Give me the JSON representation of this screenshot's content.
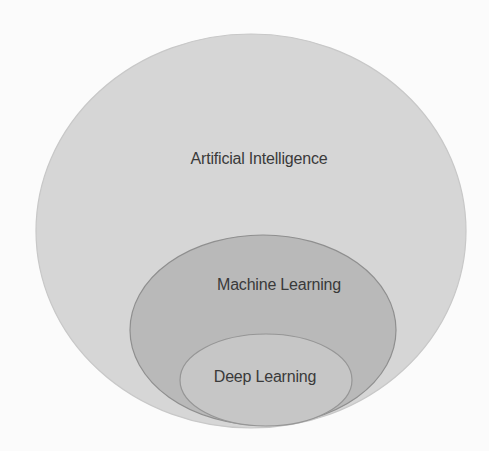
{
  "diagram": {
    "type": "nested-venn",
    "title": "",
    "sets": [
      {
        "id": "ai",
        "label": "Artificial Intelligence",
        "fill": "#d6d6d6",
        "stroke": "#c8c8c8",
        "ellipse": {
          "cx": 251,
          "cy": 231,
          "rx": 215,
          "ry": 197
        },
        "label_pos": {
          "x": 259,
          "y": 159
        }
      },
      {
        "id": "ml",
        "label": "Machine Learning",
        "parent": "ai",
        "fill": "#b9b9b9",
        "stroke": "#8f8f8f",
        "ellipse": {
          "cx": 263,
          "cy": 330,
          "rx": 133,
          "ry": 95
        },
        "label_pos": {
          "x": 279,
          "y": 285
        }
      },
      {
        "id": "dl",
        "label": "Deep Learning",
        "parent": "ml",
        "fill": "#c6c6c6",
        "stroke": "#969696",
        "ellipse": {
          "cx": 266,
          "cy": 380,
          "rx": 86,
          "ry": 46
        },
        "label_pos": {
          "x": 265,
          "y": 377
        }
      }
    ]
  }
}
